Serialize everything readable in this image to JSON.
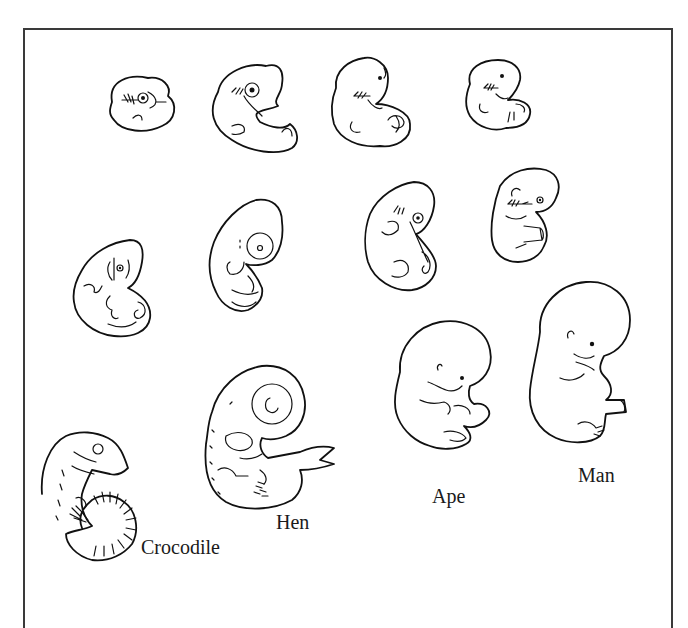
{
  "figure": {
    "type": "comparative embryo illustration",
    "style": "black line drawing on white, framed",
    "colors": {
      "ink": "#111111",
      "frame": "#3a3a3a",
      "background": "#ffffff"
    },
    "columns": [
      "Crocodile",
      "Hen",
      "Ape",
      "Man"
    ],
    "rows": 4,
    "labels": {
      "crocodile": "Crocodile",
      "hen": "Hen",
      "ape": "Ape",
      "man": "Man"
    },
    "embryos": [
      {
        "row": 1,
        "column": "Crocodile",
        "stage": "early"
      },
      {
        "row": 1,
        "column": "Hen",
        "stage": "early"
      },
      {
        "row": 1,
        "column": "Ape",
        "stage": "early"
      },
      {
        "row": 1,
        "column": "Man",
        "stage": "early"
      },
      {
        "row": 2,
        "column": "Crocodile",
        "stage": "middle"
      },
      {
        "row": 2,
        "column": "Hen",
        "stage": "middle"
      },
      {
        "row": 2,
        "column": "Ape",
        "stage": "middle"
      },
      {
        "row": 2,
        "column": "Man",
        "stage": "middle"
      },
      {
        "row": 3,
        "column": "Crocodile",
        "stage": "late"
      },
      {
        "row": 3,
        "column": "Hen",
        "stage": "late"
      },
      {
        "row": 3,
        "column": "Ape",
        "stage": "late"
      },
      {
        "row": 3,
        "column": "Man",
        "stage": "late"
      }
    ]
  }
}
